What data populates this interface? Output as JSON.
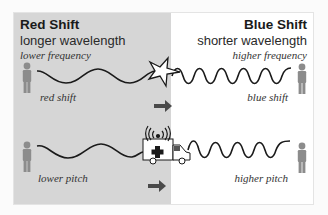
{
  "red": {
    "title": "Red Shift",
    "subtitle": "longer wavelength",
    "frequency": "lower frequency",
    "shift_label": "red shift",
    "pitch_label": "lower pitch"
  },
  "blue": {
    "title": "Blue Shift",
    "subtitle": "shorter wavelength",
    "frequency": "higher frequency",
    "shift_label": "blue shift",
    "pitch_label": "higher pitch"
  },
  "colors": {
    "left_bg": "#d6d6d6",
    "right_bg": "#ffffff",
    "wave": "#1a1a1a",
    "figure": "#8c8c8c",
    "arrow": "#4a4a4a"
  },
  "icons": [
    "person-icon",
    "star-icon",
    "ambulance-icon",
    "siren-icon",
    "arrow-right-icon"
  ]
}
